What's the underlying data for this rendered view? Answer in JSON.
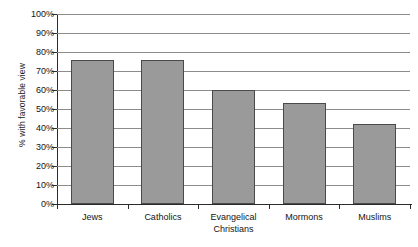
{
  "chart_data": {
    "type": "bar",
    "title": "",
    "subtitle": "",
    "xlabel": "",
    "ylabel": "% with favorable view",
    "categories": [
      "Jews",
      "Catholics",
      "Evangelical Christians",
      "Mormons",
      "Muslims"
    ],
    "category_lines": [
      [
        "Jews"
      ],
      [
        "Catholics"
      ],
      [
        "Evangelical",
        "Christians"
      ],
      [
        "Mormons"
      ],
      [
        "Muslims"
      ]
    ],
    "values": [
      76,
      76,
      60,
      53,
      42
    ],
    "value_labels": [
      "76%",
      "76%",
      "60%",
      "53%",
      "42%"
    ],
    "ylim": [
      0,
      100
    ],
    "y_ticks": [
      0,
      10,
      20,
      30,
      40,
      50,
      60,
      70,
      80,
      90,
      100
    ],
    "y_tick_labels": [
      "0%",
      "10%",
      "20%",
      "30%",
      "40%",
      "50%",
      "60%",
      "70%",
      "80%",
      "90%",
      "100%"
    ],
    "grid": true,
    "grid_axis": "y",
    "legend": false,
    "legend_position": "none",
    "bar_color": "#9a9a9a",
    "bar_border_color": "#4a4a4a",
    "gridline_color": "#8c8c8c",
    "axis_color": "#2b2b2b",
    "background_color": "#ffffff",
    "text_color": "#141414"
  }
}
